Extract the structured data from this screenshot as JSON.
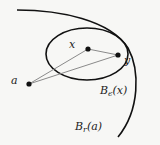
{
  "diagram": {
    "type": "metric-space-balls",
    "colors": {
      "background": "#f7f7f5",
      "stroke": "#111111",
      "segment": "#8a8a8a",
      "point": "#111111",
      "text": "#222222"
    },
    "points": [
      {
        "id": "a",
        "label": "a",
        "x": 29,
        "y": 84
      },
      {
        "id": "x",
        "label": "x",
        "x": 88,
        "y": 49
      },
      {
        "id": "y",
        "label": "y",
        "x": 118,
        "y": 55
      }
    ],
    "segments": [
      {
        "from": "a",
        "to": "x"
      },
      {
        "from": "a",
        "to": "y"
      },
      {
        "from": "x",
        "to": "y"
      }
    ],
    "balls": [
      {
        "id": "ball-eps-x",
        "label_main": "B",
        "label_sub": "ϵ",
        "label_arg": "(x)",
        "shape": "ellipse"
      },
      {
        "id": "ball-r-a",
        "label_main": "B",
        "label_sub": "r",
        "label_arg": "(a)",
        "shape": "arc"
      }
    ]
  }
}
